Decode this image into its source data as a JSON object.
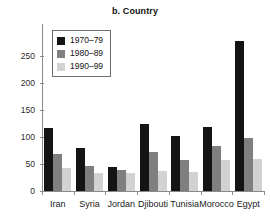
{
  "chart_data": {
    "type": "bar",
    "title": "b. Country",
    "xlabel": "",
    "ylabel": "",
    "ylim": [
      0,
      280
    ],
    "yticks": [
      0,
      50,
      100,
      150,
      200,
      250
    ],
    "ytick_labels": [
      "0",
      "50",
      "100",
      "150",
      "200",
      "250"
    ],
    "grid": false,
    "legend_position": "upper-left-inside",
    "categories": [
      "Iran",
      "Syria",
      "Jordan",
      "Djibouti",
      "Tunisia",
      "Morocco",
      "Egypt"
    ],
    "series": [
      {
        "name": "1970–79",
        "color": "#141414",
        "values": [
          117,
          79,
          44,
          124,
          101,
          119,
          278
        ]
      },
      {
        "name": "1980–89",
        "color": "#7f7f7f",
        "values": [
          68,
          47,
          38,
          72,
          57,
          83,
          98
        ]
      },
      {
        "name": "1990–99",
        "color": "#d2d2d2",
        "values": [
          42,
          34,
          33,
          37,
          35,
          57,
          59
        ]
      }
    ]
  }
}
